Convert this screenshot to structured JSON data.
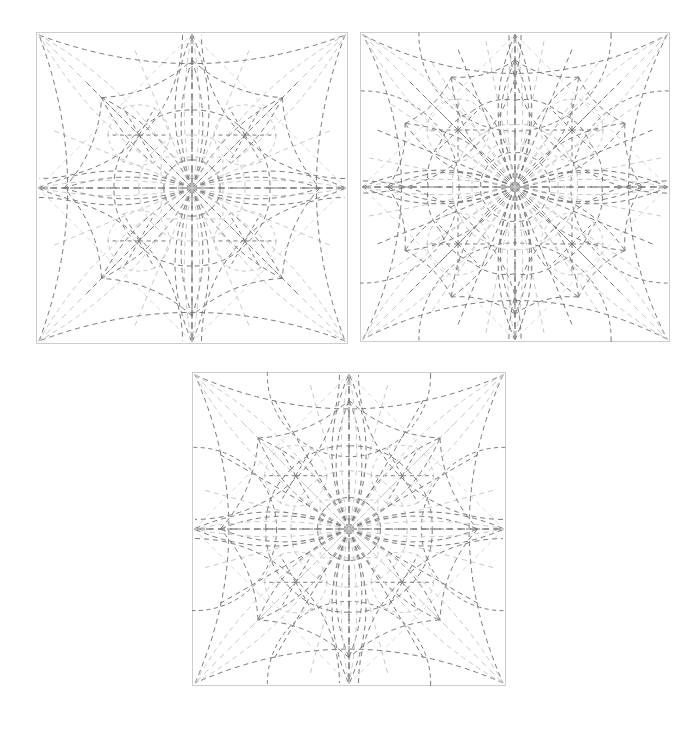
{
  "document": {
    "title": "Origami Crease Pattern Figure Set",
    "background_color": "#ffffff",
    "width": 694,
    "height": 731,
    "panel_count": 3,
    "caption": ""
  },
  "style": {
    "frame_color": "#c8c8c8",
    "frame_width": 0.9,
    "crease_dark": "#595959",
    "crease_mid": "#7a7a7a",
    "crease_light": "#c9c9c9",
    "crease_faint": "#dcdcdc",
    "dash_pattern": "5,4",
    "dash_pattern_fine": "4,3.5",
    "stroke_width": 1.0
  },
  "panels": [
    {
      "id": "panel-top-left",
      "label": "Crease pattern A",
      "x": 36,
      "y": 32,
      "size": 312,
      "rays": 8,
      "ring_radii": [
        0.18,
        0.34,
        0.5
      ],
      "petal_count": 8,
      "arc_bulge": 0.34,
      "diagonals": true,
      "inner_square": 0.28,
      "variant": "a"
    },
    {
      "id": "panel-top-right",
      "label": "Crease pattern B",
      "x": 360,
      "y": 32,
      "size": 310,
      "rays": 16,
      "ring_radii": [
        0.22,
        0.4,
        0.56
      ],
      "petal_count": 12,
      "arc_bulge": 0.46,
      "diagonals": true,
      "inner_square": 0.3,
      "variant": "b"
    },
    {
      "id": "panel-bottom-center",
      "label": "Crease pattern C",
      "x": 192,
      "y": 372,
      "size": 314,
      "rays": 12,
      "ring_radii": [
        0.2,
        0.37,
        0.53
      ],
      "petal_count": 8,
      "arc_bulge": 0.4,
      "diagonals": true,
      "inner_square": 0.26,
      "variant": "c"
    }
  ],
  "chart_data": {
    "type": "diagram",
    "subtitle": "",
    "figures": [
      {
        "name": "Crease pattern A",
        "position": "top-left",
        "symmetry_order": 8,
        "bounding_square_px": 312,
        "line_style": "dashed",
        "features": [
          "radial rays",
          "lens arcs",
          "corner diagonals",
          "concentric petal rings"
        ]
      },
      {
        "name": "Crease pattern B",
        "position": "top-right",
        "symmetry_order": 16,
        "bounding_square_px": 310,
        "line_style": "dashed",
        "features": [
          "radial rays",
          "large circle arcs",
          "corner diagonals",
          "petal rosette"
        ]
      },
      {
        "name": "Crease pattern C",
        "position": "bottom-center",
        "symmetry_order": 12,
        "bounding_square_px": 314,
        "line_style": "dashed",
        "features": [
          "radial rays",
          "lens arcs",
          "corner diagonals",
          "star rosette"
        ]
      }
    ],
    "legend": [],
    "xlabel": "",
    "ylabel": "",
    "grid": false
  }
}
